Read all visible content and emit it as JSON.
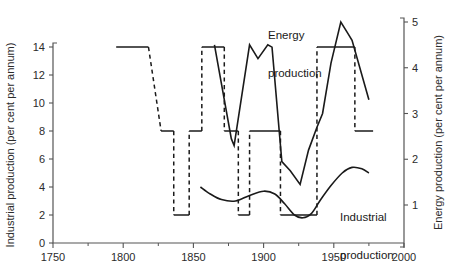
{
  "chart_data": {
    "type": "line",
    "title": "",
    "subtitle": "",
    "xlabel": "",
    "ylabel": "Industrial production (per cent per annum)",
    "y2label": "Energy production (per cent per annum)",
    "xlim": [
      1750,
      2000
    ],
    "ylim": [
      0,
      14
    ],
    "y2lim": [
      0,
      5.5
    ],
    "xticks": [
      1750,
      1800,
      1850,
      1900,
      1950,
      2000
    ],
    "xticklabels": [
      "1750",
      "1800",
      "1850",
      "1900",
      "1950",
      "2000"
    ],
    "xminorticks": [
      1775,
      1825,
      1875,
      1925,
      1975
    ],
    "yticks": [
      0,
      2,
      4,
      6,
      8,
      10,
      12,
      14
    ],
    "yticklabels": [
      "0",
      "2",
      "4",
      "6",
      "8",
      "10",
      "12",
      "14"
    ],
    "y2ticks": [
      1,
      2,
      3,
      4,
      5
    ],
    "y2ticklabels": [
      "1",
      "2",
      "3",
      "4",
      "5"
    ],
    "grid": false,
    "legend_position": "inline-annotations",
    "annotations": [
      {
        "text": "Energy\nproduction",
        "x": 1912,
        "y_axis": "right",
        "style": "inline-label"
      },
      {
        "text": "Industrial\nproduction",
        "x": 1952,
        "y_axis": "left",
        "style": "inline-label"
      }
    ],
    "series": [
      {
        "name": "Industrial production",
        "axis": "left",
        "style": "step",
        "linestyle": "mixed-solid-dashed",
        "note": "Step function; solid horizontal treads, dashed connecting risers and some treads",
        "steps": [
          {
            "x_start": 1795,
            "x_end": 1818,
            "value": 14,
            "linestyle": "solid"
          },
          {
            "x_start": 1818,
            "x_end": 1827,
            "value": null,
            "linestyle": "dashed",
            "note": "descending ramp 14 to 8"
          },
          {
            "x_start": 1827,
            "x_end": 1836,
            "value": 8,
            "linestyle": "solid"
          },
          {
            "x_start": 1836,
            "x_end": 1836,
            "value": null,
            "linestyle": "dashed",
            "note": "drop 8 to 2"
          },
          {
            "x_start": 1836,
            "x_end": 1847,
            "value": 2,
            "linestyle": "solid"
          },
          {
            "x_start": 1847,
            "x_end": 1847,
            "value": null,
            "linestyle": "dashed",
            "note": "rise 2 to 8"
          },
          {
            "x_start": 1847,
            "x_end": 1856,
            "value": 8,
            "linestyle": "solid"
          },
          {
            "x_start": 1856,
            "x_end": 1856,
            "value": null,
            "linestyle": "dashed",
            "note": "rise 8 to 14"
          },
          {
            "x_start": 1856,
            "x_end": 1872,
            "value": 14,
            "linestyle": "solid"
          },
          {
            "x_start": 1872,
            "x_end": 1872,
            "value": null,
            "linestyle": "dashed",
            "note": "drop 14 to 8"
          },
          {
            "x_start": 1872,
            "x_end": 1882,
            "value": 8,
            "linestyle": "solid"
          },
          {
            "x_start": 1882,
            "x_end": 1882,
            "value": null,
            "linestyle": "dashed",
            "note": "drop 8 to 2"
          },
          {
            "x_start": 1882,
            "x_end": 1890,
            "value": 2,
            "linestyle": "solid"
          },
          {
            "x_start": 1890,
            "x_end": 1890,
            "value": null,
            "linestyle": "dashed",
            "note": "rise 2 to 8"
          },
          {
            "x_start": 1890,
            "x_end": 1912,
            "value": 8,
            "linestyle": "solid"
          },
          {
            "x_start": 1912,
            "x_end": 1912,
            "value": null,
            "linestyle": "dashed",
            "note": "drop 8 to 2"
          },
          {
            "x_start": 1912,
            "x_end": 1938,
            "value": 2,
            "linestyle": "solid"
          },
          {
            "x_start": 1938,
            "x_end": 1938,
            "value": null,
            "linestyle": "dashed",
            "note": "rise 2 to 14"
          },
          {
            "x_start": 1938,
            "x_end": 1965,
            "value": 14,
            "linestyle": "solid"
          },
          {
            "x_start": 1965,
            "x_end": 1965,
            "value": null,
            "linestyle": "dashed",
            "note": "drop 14 to 8"
          },
          {
            "x_start": 1965,
            "x_end": 1978,
            "value": 8,
            "linestyle": "solid"
          }
        ]
      },
      {
        "name": "Industrial production (smooth)",
        "axis": "left",
        "style": "smooth-curve",
        "linestyle": "solid",
        "points": [
          {
            "x": 1855,
            "y": 4.0
          },
          {
            "x": 1862,
            "y": 3.5
          },
          {
            "x": 1870,
            "y": 3.1
          },
          {
            "x": 1880,
            "y": 3.0
          },
          {
            "x": 1890,
            "y": 3.4
          },
          {
            "x": 1900,
            "y": 3.7
          },
          {
            "x": 1908,
            "y": 3.5
          },
          {
            "x": 1915,
            "y": 2.8
          },
          {
            "x": 1922,
            "y": 2.0
          },
          {
            "x": 1928,
            "y": 1.8
          },
          {
            "x": 1934,
            "y": 2.1
          },
          {
            "x": 1940,
            "y": 3.0
          },
          {
            "x": 1948,
            "y": 4.1
          },
          {
            "x": 1956,
            "y": 5.0
          },
          {
            "x": 1963,
            "y": 5.4
          },
          {
            "x": 1970,
            "y": 5.3
          },
          {
            "x": 1975,
            "y": 5.0
          }
        ]
      },
      {
        "name": "Energy production",
        "axis": "right",
        "style": "line",
        "linestyle": "solid",
        "points": [
          {
            "x": 1865,
            "y": 4.5
          },
          {
            "x": 1877,
            "y": 2.45
          },
          {
            "x": 1879,
            "y": 2.3
          },
          {
            "x": 1890,
            "y": 4.5
          },
          {
            "x": 1896,
            "y": 4.2
          },
          {
            "x": 1903,
            "y": 4.5
          },
          {
            "x": 1906,
            "y": 4.45
          },
          {
            "x": 1913,
            "y": 1.95
          },
          {
            "x": 1919,
            "y": 1.75
          },
          {
            "x": 1926,
            "y": 1.45
          },
          {
            "x": 1932,
            "y": 2.2
          },
          {
            "x": 1938,
            "y": 2.7
          },
          {
            "x": 1942,
            "y": 3.0
          },
          {
            "x": 1948,
            "y": 4.1
          },
          {
            "x": 1955,
            "y": 5.0
          },
          {
            "x": 1960,
            "y": 4.75
          },
          {
            "x": 1963,
            "y": 4.6
          },
          {
            "x": 1975,
            "y": 3.3
          }
        ]
      }
    ]
  },
  "labels": {
    "energy_line1": "Energy",
    "energy_line2": "production",
    "industrial_line1": "Industrial",
    "industrial_line2": "production"
  }
}
